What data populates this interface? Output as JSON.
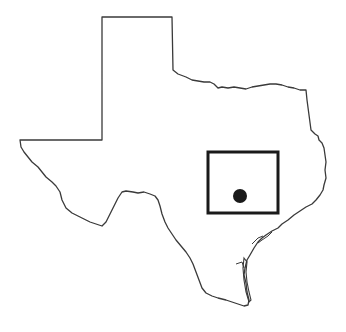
{
  "map": {
    "region": "Texas",
    "outline_color": "#3a3a3a",
    "marker_color": "#1a1a1a",
    "study_area_box": {
      "x": 208,
      "y": 152,
      "width": 70,
      "height": 61,
      "stroke_width": 3
    },
    "location_marker": {
      "cx": 240,
      "cy": 196,
      "r": 7,
      "shape": "filled-circle"
    }
  }
}
